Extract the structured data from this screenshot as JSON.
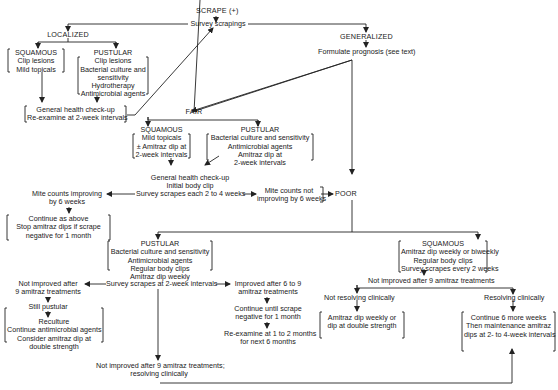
{
  "diagram": {
    "root": "SCRAPE (+)",
    "survey": "Survey scrapings",
    "localized": {
      "label": "LOCALIZED",
      "squamous": {
        "title": "SQUAMOUS",
        "lines": [
          "Clip lesions",
          "Mild topicals"
        ]
      },
      "pustular": {
        "title": "PUSTULAR",
        "lines": [
          "Clip lesions",
          "Bacterial culture and",
          "sensitivity",
          "Hydrotherapy",
          "Antimicrobial agents"
        ]
      },
      "followup": [
        "General health check-up",
        "Re-examine at 2-week intervals"
      ]
    },
    "generalized": {
      "label": "GENERALIZED",
      "prognosis": "Formulate prognosis (see text)"
    },
    "fair": {
      "label": "FAIR",
      "squamous": {
        "title": "SQUAMOUS",
        "lines": [
          "Mild topicals",
          "± Amitraz dip at",
          "2-week intervals"
        ]
      },
      "pustular": {
        "title": "PUSTULAR",
        "lines": [
          "Bacterial culture and sensitivity",
          "Antimicrobial agents",
          "Amitraz dip at",
          "2-week intervals"
        ]
      },
      "checkup": [
        "General health check-up",
        "Initial body clip"
      ],
      "survey": "Survey scrapes each 2 to 4 weeks",
      "improving": [
        "Mite counts improving",
        "by 6 weeks"
      ],
      "improving_action": [
        "Continue as above",
        "Stop amitraz dips if scrape",
        "negative for 1 month"
      ],
      "not_improving": [
        "Mite counts not",
        "improving by 6 weeks"
      ]
    },
    "poor": {
      "label": "POOR",
      "pustular": {
        "title": "PUSTULAR",
        "lines": [
          "Bacterial culture and sensitivity",
          "Antimicrobial agents",
          "Regular body clips",
          "Amitraz dip weekly"
        ],
        "survey": "Survey scrapes at 2-week intervals",
        "not_improved": [
          "Not improved after",
          "9 amitraz treatments"
        ],
        "still_pustular": "Still pustular",
        "reculture": [
          "Reculture",
          "Continue antimicrobial agents",
          "Consider amitraz dip at",
          "double strength"
        ],
        "improved": [
          "Improved after 6 to 9",
          "amitraz treatments"
        ],
        "continue": [
          "Continue until scrape",
          "negative for 1 month"
        ],
        "reexamine": [
          "Re-examine at 1 to 2 months",
          "for next 6 months"
        ],
        "not_improved_resolving": [
          "Not improved after 9 amitraz treatments;",
          "resolving clinically"
        ]
      },
      "squamous": {
        "title": "SQUAMOUS",
        "lines": [
          "Amitraz dip weekly or biweekly",
          "Regular body clips",
          "Survey scrapes every 2 weeks"
        ],
        "not_improved": "Not improved after 9 amitraz treatments",
        "not_resolving": "Not resolving clinically",
        "not_resolving_action": [
          "Amitraz dip weekly or",
          "dip at double strength"
        ],
        "resolving": "Resolving clinically",
        "resolving_action": [
          "Continue 6 more weeks",
          "Then maintenance amitraz",
          "dips at 2- to 4-week intervals"
        ]
      }
    }
  }
}
